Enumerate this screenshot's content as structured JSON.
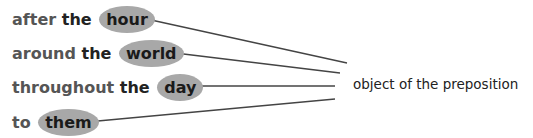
{
  "phrases": [
    {
      "preposition": "after",
      "article": "the",
      "object": "hour"
    },
    {
      "preposition": "around",
      "article": "the",
      "object": "world"
    },
    {
      "preposition": "throughout",
      "article": "the",
      "object": "day"
    },
    {
      "preposition": "to",
      "article": "",
      "object": "them"
    }
  ],
  "label": "object of the preposition",
  "colors": {
    "ellipse": "#a8a8a8",
    "arrow": "#444444",
    "text": "#555555"
  }
}
